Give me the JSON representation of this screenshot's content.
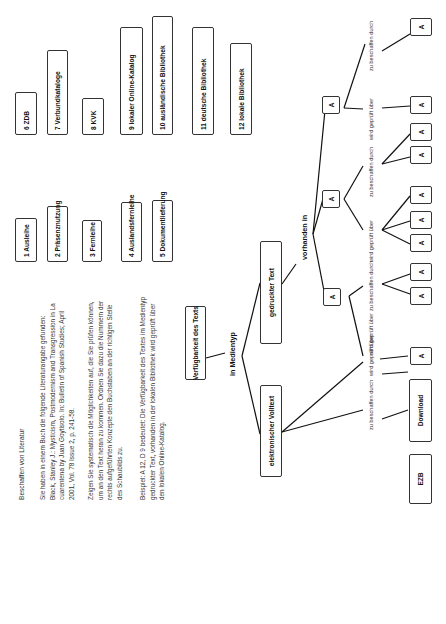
{
  "page": {
    "orientation": "rotated-90-ccw",
    "heading": "Beschaffen von Literatur",
    "intro_lines": [
      "Sie haben in einem Buch die folgende Literaturangabe gefunden:",
      "Black, Stanley J.: Mysticism, Postmodernism and Transgression in La",
      "cuarentena by Juan Goytisolo. In: Bulletin of Spanish Studies; April",
      "2001, Vol. 78 Issue 2, p. 241-58."
    ],
    "task_lines": [
      "Zeigen Sie systematisch die Möglichkeiten auf, die Sie prüfen können,",
      "um an den Text heran zu kommen. Ordnen Sie dazu die Nummern der",
      "rechts aufgeführten Konzepte den Buchstaben an der richtigen Stelle",
      "des Schaubilds zu."
    ],
    "example_lines": [
      "Beispiel: A 12, D 9 bedeutet: Die Verfügbarkeit des Textes im Medientyp",
      "gedruckter Text, vorhanden in der lokalen Bibliothek wird geprüft über",
      "den lokalen Online-Katalog."
    ]
  },
  "concepts_left": [
    {
      "label": "1 Ausleihe"
    },
    {
      "label": "2 Präsenznutzung"
    },
    {
      "label": "3 Fernleihe"
    },
    {
      "label": "4 Auslandsfernleihe"
    },
    {
      "label": "5 Dokumentlieferung"
    }
  ],
  "concepts_right": [
    {
      "label": "6 ZDB"
    },
    {
      "label": "7 Verbundkataloge"
    },
    {
      "label": "8 KVK"
    },
    {
      "label": "9 lokaler Online-Katalog"
    },
    {
      "label": "10 ausländische Bibliothek"
    },
    {
      "label": "11 deutsche Bibliothek"
    },
    {
      "label": "12 lokale Bibliothek"
    }
  ],
  "diagram": {
    "root": "Verfügbarkeit des Texts",
    "root_edge_label": "in Medientyp",
    "branch_electronic": "elektronischer Volltext",
    "branch_printed": "gedruckter Text",
    "printed_edge_label": "vorhanden in",
    "ezb": "EZB",
    "download": "Download",
    "placeholder": "A",
    "edge_checked": "wird geprüft über",
    "edge_obtain": "zu beschaffen durch"
  }
}
